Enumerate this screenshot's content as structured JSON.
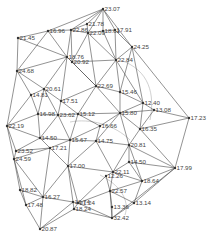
{
  "diagram": {
    "type": "triangulated-network",
    "nodes": [
      {
        "id": "n1",
        "label": "23.07",
        "x": 103,
        "y": 9
      },
      {
        "id": "n2",
        "label": "21.78",
        "x": 87,
        "y": 24
      },
      {
        "id": "n3",
        "label": "22.86",
        "x": 71,
        "y": 30
      },
      {
        "id": "n4",
        "label": "22.09",
        "x": 88,
        "y": 33
      },
      {
        "id": "n5",
        "label": "18.61",
        "x": 103,
        "y": 31
      },
      {
        "id": "n6",
        "label": "17.91",
        "x": 115,
        "y": 30
      },
      {
        "id": "n7",
        "label": "21.45",
        "x": 18,
        "y": 38
      },
      {
        "id": "n8",
        "label": "16.96",
        "x": 48,
        "y": 31
      },
      {
        "id": "n9",
        "label": "24.25",
        "x": 132,
        "y": 47
      },
      {
        "id": "n10",
        "label": "18.76",
        "x": 67,
        "y": 57
      },
      {
        "id": "n11",
        "label": "20.92",
        "x": 72,
        "y": 62
      },
      {
        "id": "n12",
        "label": "22.84",
        "x": 116,
        "y": 60
      },
      {
        "id": "n13",
        "label": "24.68",
        "x": 17,
        "y": 71
      },
      {
        "id": "n14",
        "label": "20.61",
        "x": 44,
        "y": 89
      },
      {
        "id": "n15",
        "label": "14.81",
        "x": 31,
        "y": 95
      },
      {
        "id": "n16",
        "label": "22.69",
        "x": 96,
        "y": 86
      },
      {
        "id": "n17",
        "label": "15.46",
        "x": 120,
        "y": 92
      },
      {
        "id": "n18",
        "label": "17.51",
        "x": 61,
        "y": 101
      },
      {
        "id": "n19",
        "label": "12.40",
        "x": 143,
        "y": 103
      },
      {
        "id": "n20",
        "label": "13.08",
        "x": 154,
        "y": 110
      },
      {
        "id": "n21",
        "label": "17.23",
        "x": 189,
        "y": 118
      },
      {
        "id": "n22",
        "label": "16.98",
        "x": 38,
        "y": 114
      },
      {
        "id": "n23",
        "label": "23.62",
        "x": 58,
        "y": 115
      },
      {
        "id": "n24",
        "label": "15.12",
        "x": 78,
        "y": 114
      },
      {
        "id": "n25",
        "label": "15.80",
        "x": 120,
        "y": 113
      },
      {
        "id": "n26",
        "label": "22.19",
        "x": 7,
        "y": 126
      },
      {
        "id": "n27",
        "label": "16.66",
        "x": 100,
        "y": 126
      },
      {
        "id": "n28",
        "label": "16.35",
        "x": 140,
        "y": 129
      },
      {
        "id": "n29",
        "label": "14.50",
        "x": 40,
        "y": 138
      },
      {
        "id": "n30",
        "label": "15.67",
        "x": 70,
        "y": 140
      },
      {
        "id": "n31",
        "label": "14.75",
        "x": 96,
        "y": 141
      },
      {
        "id": "n32",
        "label": "20.81",
        "x": 129,
        "y": 145
      },
      {
        "id": "n33",
        "label": "17.21",
        "x": 50,
        "y": 148
      },
      {
        "id": "n34",
        "label": "23.52",
        "x": 16,
        "y": 151
      },
      {
        "id": "n35",
        "label": "24.59",
        "x": 14,
        "y": 159
      },
      {
        "id": "n36",
        "label": "17.00",
        "x": 68,
        "y": 166
      },
      {
        "id": "n37",
        "label": "14.50",
        "x": 129,
        "y": 162
      },
      {
        "id": "n38",
        "label": "17.99",
        "x": 175,
        "y": 168
      },
      {
        "id": "n39",
        "label": "22.11",
        "x": 113,
        "y": 172
      },
      {
        "id": "n40",
        "label": "12.26",
        "x": 106,
        "y": 176
      },
      {
        "id": "n41",
        "label": "18.64",
        "x": 142,
        "y": 181
      },
      {
        "id": "n42",
        "label": "18.82",
        "x": 20,
        "y": 190
      },
      {
        "id": "n43",
        "label": "16.27",
        "x": 43,
        "y": 197
      },
      {
        "id": "n44",
        "label": "22.57",
        "x": 110,
        "y": 191
      },
      {
        "id": "n45",
        "label": "17.48",
        "x": 26,
        "y": 205
      },
      {
        "id": "n46",
        "label": "16.74",
        "x": 73,
        "y": 202
      },
      {
        "id": "n47",
        "label": "21.24",
        "x": 78,
        "y": 203
      },
      {
        "id": "n48",
        "label": "18.24",
        "x": 74,
        "y": 209
      },
      {
        "id": "n49",
        "label": "13.14",
        "x": 134,
        "y": 203
      },
      {
        "id": "n50",
        "label": "13.36",
        "x": 112,
        "y": 207
      },
      {
        "id": "n51",
        "label": "32.42",
        "x": 112,
        "y": 218
      },
      {
        "id": "n52",
        "label": "20.87",
        "x": 40,
        "y": 229
      }
    ],
    "edges": [
      [
        "n1",
        "n2"
      ],
      [
        "n1",
        "n3"
      ],
      [
        "n1",
        "n4"
      ],
      [
        "n1",
        "n5"
      ],
      [
        "n1",
        "n6"
      ],
      [
        "n1",
        "n9"
      ],
      [
        "n1",
        "n8"
      ],
      [
        "n7",
        "n8"
      ],
      [
        "n7",
        "n13"
      ],
      [
        "n7",
        "n10"
      ],
      [
        "n8",
        "n3"
      ],
      [
        "n8",
        "n10"
      ],
      [
        "n8",
        "n13"
      ],
      [
        "n3",
        "n2"
      ],
      [
        "n3",
        "n4"
      ],
      [
        "n3",
        "n10"
      ],
      [
        "n3",
        "n11"
      ],
      [
        "n2",
        "n4"
      ],
      [
        "n4",
        "n5"
      ],
      [
        "n4",
        "n11"
      ],
      [
        "n4",
        "n12"
      ],
      [
        "n4",
        "n16"
      ],
      [
        "n5",
        "n6"
      ],
      [
        "n5",
        "n12"
      ],
      [
        "n6",
        "n12"
      ],
      [
        "n6",
        "n9"
      ],
      [
        "n9",
        "n12"
      ],
      [
        "n9",
        "n17"
      ],
      [
        "n9",
        "n19"
      ],
      [
        "n9",
        "n21"
      ],
      [
        "n10",
        "n11"
      ],
      [
        "n10",
        "n13"
      ],
      [
        "n10",
        "n14"
      ],
      [
        "n10",
        "n16"
      ],
      [
        "n10",
        "n18"
      ],
      [
        "n11",
        "n16"
      ],
      [
        "n11",
        "n12"
      ],
      [
        "n12",
        "n16"
      ],
      [
        "n12",
        "n17"
      ],
      [
        "n12",
        "n19"
      ],
      [
        "n13",
        "n14"
      ],
      [
        "n13",
        "n15"
      ],
      [
        "n13",
        "n26"
      ],
      [
        "n14",
        "n15"
      ],
      [
        "n14",
        "n18"
      ],
      [
        "n14",
        "n23"
      ],
      [
        "n14",
        "n22"
      ],
      [
        "n15",
        "n22"
      ],
      [
        "n15",
        "n26"
      ],
      [
        "n16",
        "n17"
      ],
      [
        "n16",
        "n18"
      ],
      [
        "n16",
        "n24"
      ],
      [
        "n16",
        "n25"
      ],
      [
        "n17",
        "n19"
      ],
      [
        "n17",
        "n25"
      ],
      [
        "n18",
        "n23"
      ],
      [
        "n18",
        "n24"
      ],
      [
        "n19",
        "n20"
      ],
      [
        "n19",
        "n25"
      ],
      [
        "n19",
        "n28"
      ],
      [
        "n20",
        "n21"
      ],
      [
        "n20",
        "n25"
      ],
      [
        "n20",
        "n28"
      ],
      [
        "n21",
        "n28"
      ],
      [
        "n21",
        "n38"
      ],
      [
        "n22",
        "n23"
      ],
      [
        "n22",
        "n26"
      ],
      [
        "n22",
        "n29"
      ],
      [
        "n23",
        "n24"
      ],
      [
        "n23",
        "n29"
      ],
      [
        "n23",
        "n30"
      ],
      [
        "n24",
        "n27"
      ],
      [
        "n24",
        "n30"
      ],
      [
        "n24",
        "n25"
      ],
      [
        "n25",
        "n27"
      ],
      [
        "n25",
        "n28"
      ],
      [
        "n25",
        "n31"
      ],
      [
        "n25",
        "n32"
      ],
      [
        "n26",
        "n29"
      ],
      [
        "n26",
        "n34"
      ],
      [
        "n26",
        "n35"
      ],
      [
        "n27",
        "n30"
      ],
      [
        "n27",
        "n31"
      ],
      [
        "n28",
        "n32"
      ],
      [
        "n28",
        "n38"
      ],
      [
        "n29",
        "n30"
      ],
      [
        "n29",
        "n33"
      ],
      [
        "n29",
        "n34"
      ],
      [
        "n30",
        "n31"
      ],
      [
        "n30",
        "n33"
      ],
      [
        "n30",
        "n36"
      ],
      [
        "n31",
        "n32"
      ],
      [
        "n31",
        "n36"
      ],
      [
        "n31",
        "n39"
      ],
      [
        "n32",
        "n37"
      ],
      [
        "n32",
        "n38"
      ],
      [
        "n32",
        "n41"
      ],
      [
        "n32",
        "n39"
      ],
      [
        "n33",
        "n34"
      ],
      [
        "n33",
        "n35"
      ],
      [
        "n33",
        "n36"
      ],
      [
        "n33",
        "n43"
      ],
      [
        "n34",
        "n35"
      ],
      [
        "n35",
        "n42"
      ],
      [
        "n35",
        "n43"
      ],
      [
        "n35",
        "n45"
      ],
      [
        "n36",
        "n39"
      ],
      [
        "n36",
        "n43"
      ],
      [
        "n36",
        "n47"
      ],
      [
        "n36",
        "n46"
      ],
      [
        "n37",
        "n39"
      ],
      [
        "n37",
        "n41"
      ],
      [
        "n37",
        "n38"
      ],
      [
        "n38",
        "n41"
      ],
      [
        "n38",
        "n49"
      ],
      [
        "n38",
        "n51"
      ],
      [
        "n39",
        "n40"
      ],
      [
        "n39",
        "n44"
      ],
      [
        "n39",
        "n41"
      ],
      [
        "n40",
        "n44"
      ],
      [
        "n40",
        "n47"
      ],
      [
        "n41",
        "n44"
      ],
      [
        "n41",
        "n49"
      ],
      [
        "n42",
        "n43"
      ],
      [
        "n42",
        "n45"
      ],
      [
        "n43",
        "n45"
      ],
      [
        "n43",
        "n46"
      ],
      [
        "n43",
        "n52"
      ],
      [
        "n44",
        "n49"
      ],
      [
        "n44",
        "n50"
      ],
      [
        "n44",
        "n51"
      ],
      [
        "n44",
        "n47"
      ],
      [
        "n45",
        "n52"
      ],
      [
        "n46",
        "n47"
      ],
      [
        "n46",
        "n48"
      ],
      [
        "n46",
        "n52"
      ],
      [
        "n47",
        "n48"
      ],
      [
        "n47",
        "n51"
      ],
      [
        "n48",
        "n51"
      ],
      [
        "n48",
        "n52"
      ],
      [
        "n49",
        "n51"
      ],
      [
        "n50",
        "n51"
      ]
    ],
    "colors": {
      "edge": "#4a4a4a",
      "node": "#333333",
      "label": "#444444",
      "background": "#ffffff"
    }
  }
}
